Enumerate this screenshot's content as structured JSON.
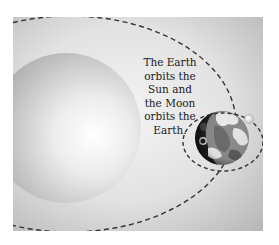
{
  "diagram": {
    "caption": "The Earth\norbits the\nSun and\nthe Moon\norbits the\nEarth.",
    "bodies": [
      {
        "name": "Sun"
      },
      {
        "name": "Earth"
      },
      {
        "name": "Moon"
      }
    ],
    "orbits": [
      {
        "name": "Earth orbit around Sun",
        "style": "dashed"
      },
      {
        "name": "Moon orbit around Earth",
        "style": "dashed"
      }
    ],
    "colors": {
      "background_panel": "#c8c8c8",
      "panel_highlight": "#f2f2f2",
      "orbit_line": "#333333",
      "sun_light": "#fbfbfb",
      "sun_dark": "#a8a8a8",
      "earth_dark": "#1e1e1e",
      "earth_land": "#6e6e6e",
      "earth_light": "#eaeaea",
      "moon": "#f4f4f4"
    }
  }
}
